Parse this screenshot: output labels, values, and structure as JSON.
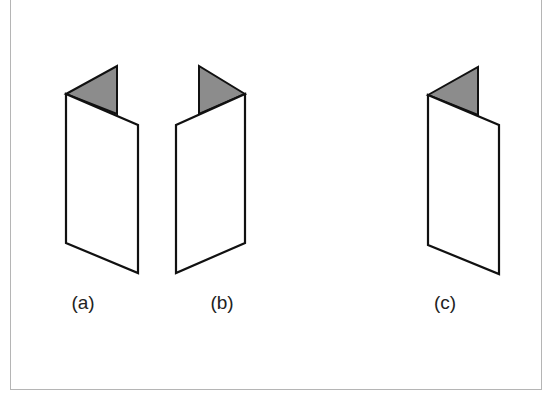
{
  "figure": {
    "colors": {
      "stroke": "#111111",
      "fold_fill": "#8c8c8c",
      "panel_fill": "#ffffff",
      "frame": "#b5b5b5"
    },
    "panels": [
      {
        "id": "a",
        "label": "(a)",
        "label_x": 83,
        "label_y": 303,
        "panel": "66,94 138,125 138,273 66,243",
        "fold": "66,94 117,66 117,114"
      },
      {
        "id": "b",
        "label": "(b)",
        "label_x": 222,
        "label_y": 303,
        "panel": "176,125 245,94 245,243 176,273",
        "fold": "245,94 199,66 199,114"
      },
      {
        "id": "c",
        "label": "(c)",
        "label_x": 445,
        "label_y": 303,
        "panel": "428,95 499,125 499,274 428,245",
        "fold": "428,95 478,67 478,115"
      }
    ]
  }
}
